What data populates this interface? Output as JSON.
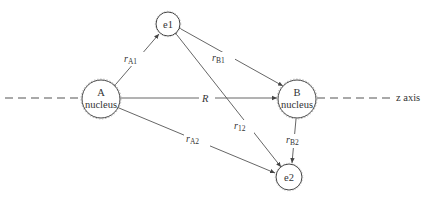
{
  "diagram": {
    "nodes": {
      "e1": {
        "label": "e1",
        "cx": 168,
        "cy": 24,
        "r": 12
      },
      "e2": {
        "label": "e2",
        "cx": 289,
        "cy": 177,
        "r": 13
      },
      "A": {
        "line1": "A",
        "line2": "nucleus",
        "cx": 101,
        "cy": 99,
        "r": 19
      },
      "B": {
        "line1": "B",
        "line2": "nucleus",
        "cx": 297,
        "cy": 99,
        "r": 19
      }
    },
    "edges": {
      "rA1": {
        "var": "r",
        "sub": "A1"
      },
      "rB1": {
        "var": "r",
        "sub": "B1"
      },
      "r12": {
        "var": "r",
        "sub": "12"
      },
      "rA2": {
        "var": "r",
        "sub": "A2"
      },
      "rB2": {
        "var": "r",
        "sub": "B2"
      },
      "R": {
        "var": "R"
      }
    },
    "axis_label": "z axis",
    "colors": {
      "line": "#555555",
      "stroke": "#444444",
      "text": "#333333"
    }
  }
}
